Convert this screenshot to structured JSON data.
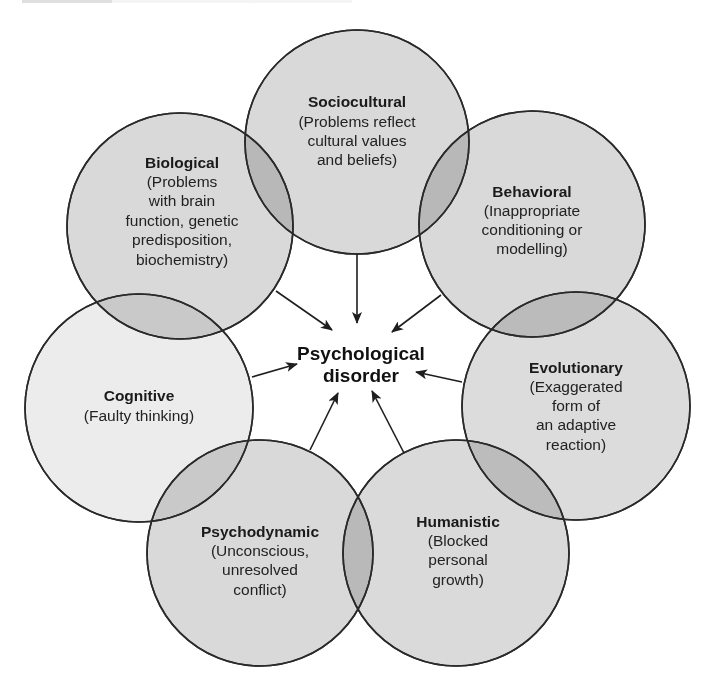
{
  "diagram": {
    "center": {
      "line1": "Psychological",
      "line2": "disorder"
    },
    "colors": {
      "circle_fill": "#d9d9d9",
      "circle_fill_light": "#ececec",
      "stroke": "#2a2a2a",
      "background": "#ffffff"
    },
    "perspectives": [
      {
        "id": "sociocultural",
        "title": "Sociocultural",
        "lines": [
          "(Problems reflect",
          "cultural values",
          "and beliefs)"
        ]
      },
      {
        "id": "biological",
        "title": "Biological",
        "lines": [
          "(Problems",
          "with brain",
          "function, genetic",
          "predisposition,",
          "biochemistry)"
        ]
      },
      {
        "id": "behavioral",
        "title": "Behavioral",
        "lines": [
          "(Inappropriate",
          "conditioning or",
          "modelling)"
        ]
      },
      {
        "id": "evolutionary",
        "title": "Evolutionary",
        "lines": [
          "(Exaggerated",
          "form of",
          "an adaptive",
          "reaction)"
        ]
      },
      {
        "id": "cognitive",
        "title": "Cognitive",
        "lines": [
          "(Faulty thinking)"
        ]
      },
      {
        "id": "psychodynamic",
        "title": "Psychodynamic",
        "lines": [
          "(Unconscious,",
          "unresolved",
          "conflict)"
        ]
      },
      {
        "id": "humanistic",
        "title": "Humanistic",
        "lines": [
          "(Blocked",
          "personal",
          "growth)"
        ]
      }
    ]
  }
}
